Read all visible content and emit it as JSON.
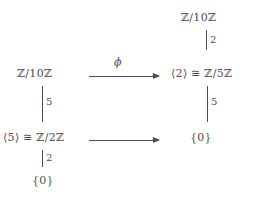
{
  "diagram": {
    "type": "commutative-diagram",
    "background_color": "#ffffff",
    "ink_color": "#4d4d4d",
    "nodes": {
      "top_right": "ℤ/10ℤ",
      "mid_left": "ℤ/10ℤ",
      "mid_right": "⟨2⟩ ≅ ℤ/5ℤ",
      "bottom_left": "⟨5⟩ ≅ ℤ/2ℤ",
      "bottom_right": "{0}",
      "bottom_left_zero": "{0}"
    },
    "edges": {
      "top_right_vertical": "2",
      "left_vertical_upper": "5",
      "left_vertical_lower": "2",
      "right_vertical": "5",
      "top_horizontal": "ϕ",
      "bottom_horizontal": ""
    }
  }
}
